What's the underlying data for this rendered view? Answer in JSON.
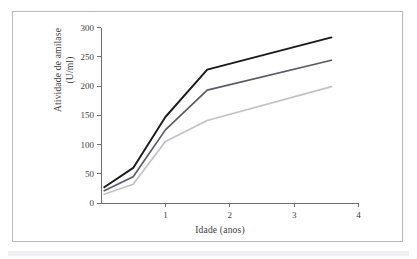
{
  "figure": {
    "background_color": "#ffffff",
    "border_color": "#b9b9bd",
    "bottom_band_color": "#f0f0f2"
  },
  "chart_data": {
    "type": "line",
    "title": "",
    "xlabel": "Idade (anos)",
    "ylabel": "Atividade de amilase\n(U/ml)",
    "ylabel_line1": "Atividade de amilase",
    "ylabel_line2": "(U/ml)",
    "xlim": [
      0,
      4
    ],
    "ylim": [
      0,
      300
    ],
    "xticks": [
      1,
      2,
      3,
      4
    ],
    "xtick_labels": [
      "1",
      "2",
      "3",
      "4"
    ],
    "yticks": [
      0,
      50,
      100,
      150,
      200,
      250,
      300
    ],
    "ytick_labels": [
      "0",
      "50",
      "100",
      "150",
      "200",
      "250",
      "300"
    ],
    "grid": false,
    "legend": "none",
    "axis_color": "#6e6e72",
    "series": [
      {
        "name": "linha-superior",
        "color": "#1a1a1a",
        "width": 1.9,
        "x": [
          0.05,
          0.5,
          1.0,
          1.65,
          3.58
        ],
        "values": [
          27,
          60,
          147,
          228,
          283
        ]
      },
      {
        "name": "linha-media",
        "color": "#5a5a66",
        "width": 1.7,
        "x": [
          0.05,
          0.5,
          1.0,
          1.65,
          3.58
        ],
        "values": [
          21,
          45,
          125,
          193,
          244
        ]
      },
      {
        "name": "linha-inferior",
        "color": "#c2c2c6",
        "width": 1.7,
        "x": [
          0.05,
          0.5,
          1.0,
          1.65,
          3.58
        ],
        "values": [
          15,
          32,
          105,
          141,
          199
        ]
      }
    ]
  }
}
